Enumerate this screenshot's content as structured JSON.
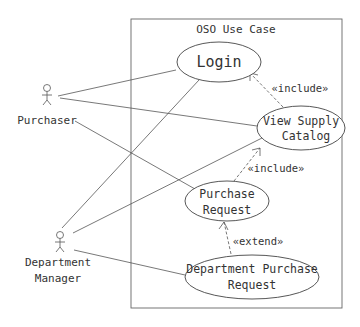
{
  "diagram": {
    "type": "uml-use-case",
    "system": {
      "title": "OSO Use Case"
    },
    "actors": [
      {
        "id": "purchaser",
        "label": "Purchaser"
      },
      {
        "id": "dept_manager",
        "label_line1": "Department",
        "label_line2": "Manager"
      }
    ],
    "use_cases": [
      {
        "id": "login",
        "label": "Login"
      },
      {
        "id": "view_catalog",
        "label_line1": "View Supply",
        "label_line2": "Catalog"
      },
      {
        "id": "purchase_request",
        "label_line1": "Purchase",
        "label_line2": "Request"
      },
      {
        "id": "dept_purchase_request",
        "label_line1": "Department Purchase",
        "label_line2": "Request"
      }
    ],
    "relationships": [
      {
        "from": "view_catalog",
        "to": "login",
        "type": "include",
        "label": "«include»"
      },
      {
        "from": "purchase_request",
        "to": "view_catalog",
        "type": "include",
        "label": "«include»"
      },
      {
        "from": "dept_purchase_request",
        "to": "purchase_request",
        "type": "extend",
        "label": "«extend»"
      }
    ],
    "associations": [
      {
        "actor": "purchaser",
        "use_case": "login"
      },
      {
        "actor": "purchaser",
        "use_case": "view_catalog"
      },
      {
        "actor": "purchaser",
        "use_case": "purchase_request"
      },
      {
        "actor": "dept_manager",
        "use_case": "login"
      },
      {
        "actor": "dept_manager",
        "use_case": "view_catalog"
      },
      {
        "actor": "dept_manager",
        "use_case": "dept_purchase_request"
      }
    ]
  }
}
